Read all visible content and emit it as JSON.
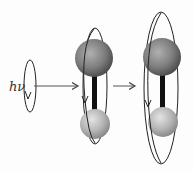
{
  "diagram": {
    "photon_label": "hν",
    "stages": [
      {
        "id": "photon",
        "description": "circularly polarized photon"
      },
      {
        "id": "molecule-before",
        "description": "diatomic molecule with small rotational orbit"
      },
      {
        "id": "molecule-after",
        "description": "diatomic molecule with larger rotational orbit"
      }
    ],
    "colors": {
      "large_atom": "#7a7a7a",
      "small_atom": "#b8b8b8",
      "bond": "#111111",
      "orbit": "#222222",
      "arrow": "#555555"
    }
  }
}
